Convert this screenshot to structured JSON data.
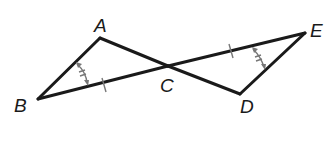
{
  "diagram": {
    "type": "geometry",
    "points": {
      "A": {
        "label": "A",
        "x": 100,
        "y": 38
      },
      "B": {
        "label": "B",
        "x": 38,
        "y": 99
      },
      "C": {
        "label": "C",
        "x": 168,
        "y": 66
      },
      "D": {
        "label": "D",
        "x": 240,
        "y": 94
      },
      "E": {
        "label": "E",
        "x": 305,
        "y": 33
      }
    },
    "segments": [
      "AB",
      "AC",
      "BC",
      "CD",
      "CE",
      "DE"
    ],
    "congruent_segments": [
      "BC",
      "CE"
    ],
    "congruent_angles": [
      "ABC",
      "CED"
    ],
    "colors": {
      "line": "#1a1a1a",
      "marks": "#777777"
    }
  }
}
